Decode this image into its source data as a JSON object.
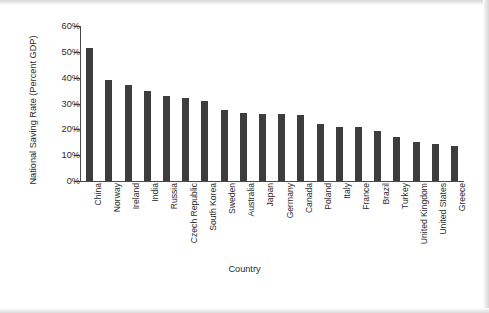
{
  "figure": {
    "background": "#ffffff",
    "bar_color": "#3d3d3d",
    "axis_color": "#4a4a4a"
  },
  "chart_data": {
    "type": "bar",
    "title": "",
    "xlabel": "Country",
    "ylabel": "National Saving Rate (Percent GDP)",
    "ylim": [
      0,
      60
    ],
    "ytick_labels": [
      "0%",
      "10%",
      "20%",
      "30%",
      "40%",
      "50%",
      "60%"
    ],
    "ytick_values": [
      0,
      10,
      20,
      30,
      40,
      50,
      60
    ],
    "grid": false,
    "legend": "none",
    "categories": [
      "China",
      "Norway",
      "Ireland",
      "India",
      "Russia",
      "Czech Republic",
      "South Korea",
      "Sweden",
      "Australia",
      "Japan",
      "Germany",
      "Canada",
      "Poland",
      "Italy",
      "France",
      "Brazil",
      "Turkey",
      "United Kingdom",
      "United States",
      "Greece"
    ],
    "values": [
      51.5,
      39.0,
      37.0,
      35.0,
      33.0,
      32.0,
      31.0,
      27.5,
      26.5,
      26.0,
      26.0,
      25.5,
      22.0,
      21.0,
      21.0,
      19.5,
      17.0,
      15.0,
      14.5,
      13.5
    ]
  }
}
